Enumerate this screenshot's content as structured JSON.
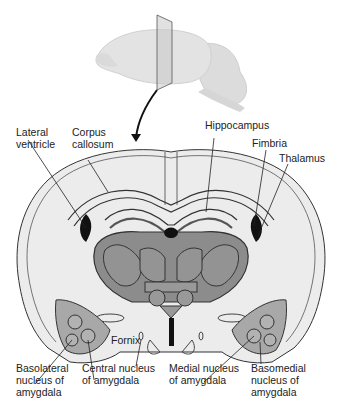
{
  "figure": {
    "colors": {
      "brain_fill": "#e6e6e6",
      "section_fill": "#ececec",
      "thalamus_fill": "#8c8c8c",
      "amygdala_fill": "#a8a8a8",
      "outline": "#3a3a3a",
      "ventricle": "#111111",
      "arrow": "#111111"
    }
  },
  "labels": {
    "lateral_ventricle": "Lateral\nventricle",
    "corpus_callosum": "Corpus\ncallosum",
    "hippocampus": "Hippocampus",
    "fimbria": "Fimbria",
    "thalamus": "Thalamus",
    "fornix": "Fornix",
    "basolateral": "Basolateral\nnucleus of\namygdala",
    "central": "Central nucleus\nof amygdala",
    "medial": "Medial nucleus\nof amygdala",
    "basomedial": "Basomedial\nnucleus of\namygdala"
  }
}
